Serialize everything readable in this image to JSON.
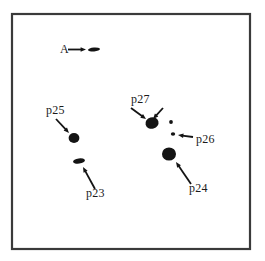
{
  "figure": {
    "type": "spot-map",
    "background_color": "#ffffff",
    "ink_color": "#141414",
    "frame": {
      "name": "figure-border",
      "x": 12,
      "y": 14,
      "width": 238,
      "height": 235,
      "stroke_color": "#3a3a3a",
      "stroke_width": 2.2
    },
    "labels": [
      {
        "id": "A",
        "text": "A",
        "x": 60,
        "y": 53
      },
      {
        "id": "p25",
        "text": "p25",
        "x": 46,
        "y": 114
      },
      {
        "id": "p23",
        "text": "p23",
        "x": 86,
        "y": 197
      },
      {
        "id": "p27",
        "text": "p27",
        "x": 131,
        "y": 103
      },
      {
        "id": "p26",
        "text": "p26",
        "x": 196,
        "y": 143
      },
      {
        "id": "p24",
        "text": "p24",
        "x": 189,
        "y": 192
      }
    ],
    "spots": [
      {
        "id": "A-spot",
        "cx": 94,
        "cy": 49.5,
        "rx": 6.0,
        "ry": 2.0,
        "rotate": -4
      },
      {
        "id": "p25-spot",
        "cx": 74,
        "cy": 138,
        "rx": 5.4,
        "ry": 5.0,
        "rotate": 0
      },
      {
        "id": "p23-spot",
        "cx": 79,
        "cy": 161,
        "rx": 6.0,
        "ry": 2.6,
        "rotate": -8
      },
      {
        "id": "p27-spot",
        "cx": 152,
        "cy": 123,
        "rx": 6.6,
        "ry": 5.8,
        "rotate": -15
      },
      {
        "id": "p26-spot-upper",
        "cx": 171,
        "cy": 122,
        "rx": 1.9,
        "ry": 1.9,
        "rotate": 0
      },
      {
        "id": "p26-spot-lower",
        "cx": 173,
        "cy": 134,
        "rx": 2.2,
        "ry": 1.7,
        "rotate": 0
      },
      {
        "id": "p24-spot",
        "cx": 169,
        "cy": 154,
        "rx": 7.0,
        "ry": 6.6,
        "rotate": 0
      }
    ],
    "arrows": [
      {
        "id": "A-arrow",
        "from": [
          68,
          49.5
        ],
        "to": [
          86,
          49.5
        ]
      },
      {
        "id": "p25-arrow",
        "from": [
          56,
          119
        ],
        "to": [
          69,
          133
        ]
      },
      {
        "id": "p23-arrow",
        "from": [
          95,
          189
        ],
        "to": [
          83,
          167
        ]
      },
      {
        "id": "p27-arrow-left",
        "from": [
          131,
          108
        ],
        "to": [
          146,
          119
        ]
      },
      {
        "id": "p27-arrow-right",
        "from": [
          163,
          108
        ],
        "to": [
          153,
          119
        ]
      },
      {
        "id": "p26-arrow",
        "from": [
          193,
          137
        ],
        "to": [
          178,
          135
        ]
      },
      {
        "id": "p24-arrow",
        "from": [
          191,
          184
        ],
        "to": [
          176,
          162
        ]
      }
    ]
  }
}
